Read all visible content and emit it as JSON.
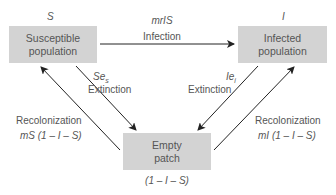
{
  "nodes": {
    "susceptible": {
      "symbol": "S",
      "label_line1": "Susceptible",
      "label_line2": "population"
    },
    "infected": {
      "symbol": "I",
      "label_line1": "Infected",
      "label_line2": "population"
    },
    "empty": {
      "label_line1": "Empty",
      "label_line2": "patch",
      "expression": "(1 – I – S)"
    }
  },
  "edges": {
    "infection": {
      "rate": "mrIS",
      "label": "Infection"
    },
    "extinction_s": {
      "rate_main": "Se",
      "rate_sub": "s",
      "label": "Extinction"
    },
    "extinction_i": {
      "rate_main": "Ie",
      "rate_sub": "i",
      "label": "Extinction"
    },
    "recolonization_s": {
      "label": "Recolonization",
      "rate": "mS (1 – I – S)"
    },
    "recolonization_i": {
      "label": "Recolonization",
      "rate": "mI (1 – I – S)"
    }
  },
  "colors": {
    "box_fill": "#d3d3d3",
    "text": "#555555",
    "arrow": "#222222"
  }
}
